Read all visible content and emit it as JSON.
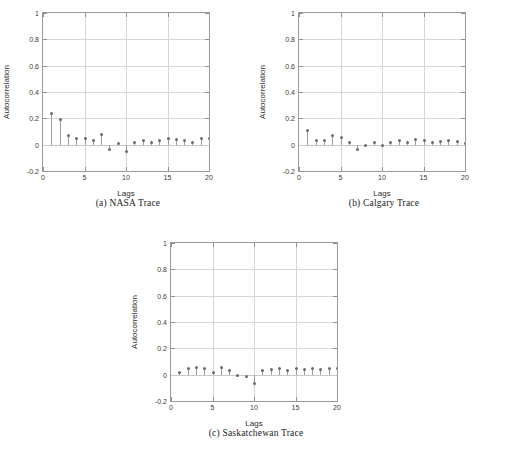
{
  "figure": {
    "panels": [
      {
        "id": "nasa",
        "caption": "(a) NASA Trace",
        "chart_ref": 0
      },
      {
        "id": "calgary",
        "caption": "(b) Calgary Trace",
        "chart_ref": 1
      },
      {
        "id": "saskatchewan",
        "caption": "(c) Saskatchewan Trace",
        "chart_ref": 2
      }
    ]
  },
  "axes": {
    "xlabel": "Lags",
    "ylabel": "Autocorrelation",
    "xticks": [
      "0",
      "5",
      "10",
      "15",
      "20"
    ],
    "xtick_values": [
      0,
      5,
      10,
      15,
      20
    ],
    "yticks": [
      "-0.2",
      "0",
      "0.2",
      "0.4",
      "0.6",
      "0.8",
      "1"
    ],
    "ytick_values": [
      -0.2,
      0,
      0.2,
      0.4,
      0.6,
      0.8,
      1
    ],
    "xlim": [
      0,
      20
    ],
    "ylim": [
      -0.2,
      1
    ]
  },
  "colors": {
    "axis": "#9a9a9a",
    "grid": "#d7d7d7",
    "stem": "#9c9c9c",
    "marker": "#6a6a6a",
    "text": "#2b2b2b",
    "background": "#ffffff"
  },
  "chart_data": [
    {
      "type": "line",
      "subtype": "stem",
      "title": "(a) NASA Trace",
      "xlabel": "Lags",
      "ylabel": "Autocorrelation",
      "xlim": [
        0,
        20
      ],
      "ylim": [
        -0.2,
        1
      ],
      "grid": true,
      "legend": "none",
      "x": [
        1,
        2,
        3,
        4,
        5,
        6,
        7,
        8,
        9,
        10,
        11,
        12,
        13,
        14,
        15,
        16,
        17,
        18,
        19,
        20
      ],
      "values": [
        0.24,
        0.19,
        0.07,
        0.05,
        0.05,
        0.03,
        0.08,
        -0.035,
        0.01,
        -0.055,
        0.015,
        0.035,
        0.02,
        0.03,
        0.045,
        0.04,
        0.03,
        0.02,
        0.045,
        0.045
      ]
    },
    {
      "type": "line",
      "subtype": "stem",
      "title": "(b) Calgary Trace",
      "xlabel": "Lags",
      "ylabel": "Autocorrelation",
      "xlim": [
        0,
        20
      ],
      "ylim": [
        -0.2,
        1
      ],
      "grid": true,
      "legend": "none",
      "x": [
        1,
        2,
        3,
        4,
        5,
        6,
        7,
        8,
        9,
        10,
        11,
        12,
        13,
        14,
        15,
        16,
        17,
        18,
        19,
        20
      ],
      "values": [
        0.11,
        0.03,
        0.035,
        0.07,
        0.055,
        0.02,
        -0.035,
        -0.01,
        0.02,
        -0.005,
        0.015,
        0.03,
        0.02,
        0.04,
        0.03,
        0.02,
        0.025,
        0.03,
        0.025,
        0.01
      ]
    },
    {
      "type": "line",
      "subtype": "stem",
      "title": "(c) Saskatchewan Trace",
      "xlabel": "Lags",
      "ylabel": "Autocorrelation",
      "xlim": [
        0,
        20
      ],
      "ylim": [
        -0.2,
        1
      ],
      "grid": true,
      "legend": "none",
      "x": [
        1,
        2,
        3,
        4,
        5,
        6,
        7,
        8,
        9,
        10,
        11,
        12,
        13,
        14,
        15,
        16,
        17,
        18,
        19,
        20
      ],
      "values": [
        0.02,
        0.045,
        0.055,
        0.05,
        0.02,
        0.055,
        0.03,
        -0.01,
        -0.015,
        -0.065,
        0.035,
        0.04,
        0.045,
        0.035,
        0.05,
        0.04,
        0.05,
        0.04,
        0.05,
        0.05
      ]
    }
  ]
}
